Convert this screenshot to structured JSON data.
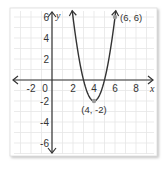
{
  "chart_data": {
    "type": "line",
    "title": "",
    "xlabel": "x",
    "ylabel": "y",
    "xlim": [
      -3,
      9
    ],
    "ylim": [
      -7,
      7
    ],
    "grid": true,
    "grid_step": 1,
    "x_ticks": [
      -2,
      0,
      2,
      4,
      6,
      8
    ],
    "y_ticks": [
      -6,
      -4,
      -2,
      2,
      4,
      6
    ],
    "x_tick_labels": [
      "-2",
      "0",
      "2",
      "4",
      "6",
      "8"
    ],
    "y_tick_labels": [
      "-6",
      "-4",
      "-2",
      "2",
      "4",
      "6"
    ],
    "series": [
      {
        "name": "parabola",
        "equation": "y = 2(x - 4)^2 - 2",
        "x": [
          2.1,
          2.5,
          3,
          3.5,
          4,
          4.5,
          5,
          5.5,
          6
        ],
        "y": [
          5.22,
          2.5,
          0,
          -1.5,
          -2,
          -1.5,
          0,
          2.5,
          6
        ],
        "color": "#333333"
      }
    ],
    "points": [
      {
        "label": "(4, -2)",
        "x": 4,
        "y": -2
      },
      {
        "label": "(6, 6)",
        "x": 6,
        "y": 6
      }
    ],
    "colors": {
      "grid": "#e6e6e6",
      "axis": "#333333",
      "curve": "#333333",
      "point": "#999999",
      "card_border": "#cccccc"
    }
  }
}
